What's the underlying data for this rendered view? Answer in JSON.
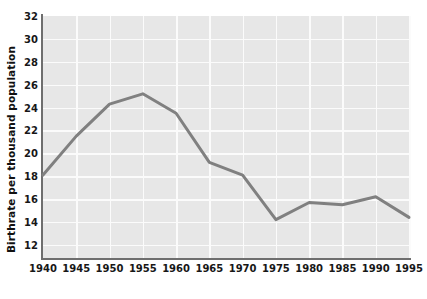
{
  "chart_data": {
    "type": "line",
    "title": "",
    "xlabel": "",
    "ylabel": "Birthrate per thousand population",
    "x": [
      1940,
      1945,
      1950,
      1955,
      1960,
      1965,
      1970,
      1975,
      1980,
      1985,
      1990,
      1995
    ],
    "values": [
      18.1,
      21.5,
      24.3,
      25.2,
      23.5,
      19.2,
      18.1,
      14.2,
      15.7,
      15.5,
      16.2,
      14.4
    ],
    "series": [
      {
        "name": "Birthrate per thousand population",
        "values": [
          18.1,
          21.5,
          24.3,
          25.2,
          23.5,
          19.2,
          18.1,
          14.2,
          15.7,
          15.5,
          16.2,
          14.4
        ]
      }
    ],
    "xtick_labels": [
      "1940",
      "1945",
      "1950",
      "1955",
      "1960",
      "1965",
      "1970",
      "1975",
      "1980",
      "1985",
      "1990",
      "1995"
    ],
    "ytick_labels": [
      "12",
      "14",
      "16",
      "18",
      "20",
      "22",
      "24",
      "26",
      "28",
      "30",
      "32"
    ],
    "yticks": [
      12,
      14,
      16,
      18,
      20,
      22,
      24,
      26,
      28,
      30,
      32
    ],
    "xlim": [
      1940,
      1995
    ],
    "ylim": [
      10.85,
      32
    ],
    "grid": true,
    "legend": "none",
    "line_color": "#808080",
    "plot_background": "#e7e7e7",
    "gridline_color": "#fbfbfb",
    "axis_color": "#6e6e6e",
    "page_background": "#ffffff"
  }
}
